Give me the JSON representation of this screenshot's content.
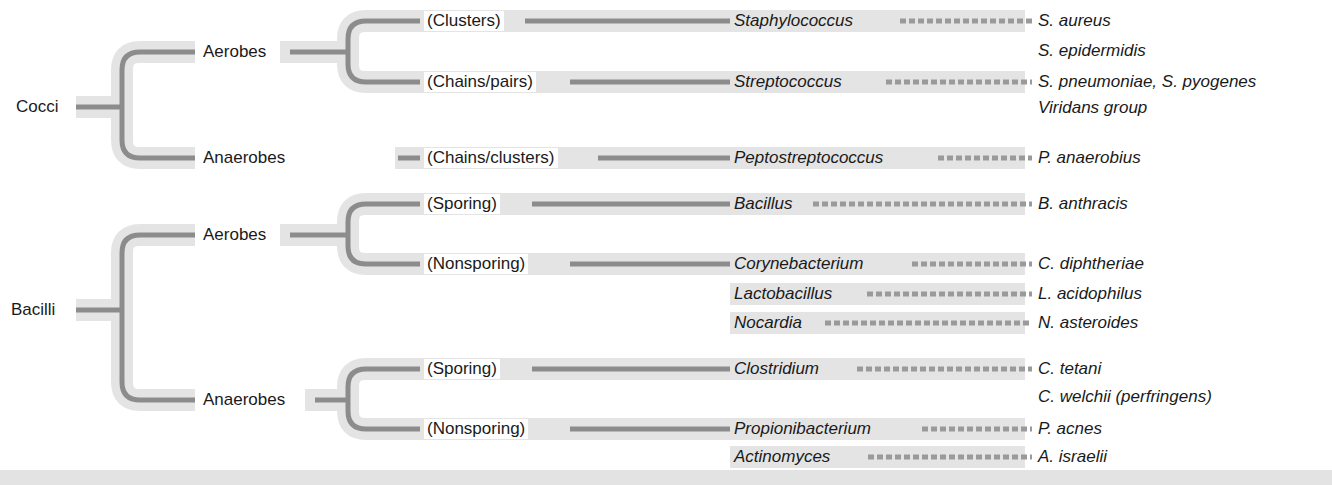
{
  "colors": {
    "line": "#8c8c8c",
    "halo": "#e4e4e4",
    "dash": "#9a9a9a",
    "text": "#1a1a1a"
  },
  "root": {
    "cocci": "Cocci",
    "bacilli": "Bacilli"
  },
  "cocci": {
    "aerobes": "Aerobes",
    "anaerobes": "Anaerobes",
    "groups": [
      {
        "label": "(Clusters)",
        "genus": "Staphylococcus",
        "species": [
          "S. aureus",
          "S. epidermidis"
        ]
      },
      {
        "label": "(Chains/pairs)",
        "genus": "Streptococcus",
        "species": [
          "S. pneumoniae, S. pyogenes",
          "Viridans group"
        ]
      },
      {
        "label": "(Chains/clusters)",
        "genus": "Peptostreptococcus",
        "species": [
          "P. anaerobius"
        ]
      }
    ]
  },
  "bacilli": {
    "aerobes": "Aerobes",
    "anaerobes": "Anaerobes",
    "groups": [
      {
        "label": "(Sporing)",
        "genus": "Bacillus",
        "species": [
          "B. anthracis"
        ]
      },
      {
        "label": "(Nonsporing)",
        "genus": "Corynebacterium",
        "species": [
          "C. diphtheriae"
        ]
      },
      {
        "label": "",
        "genus": "Lactobacillus",
        "species": [
          "L. acidophilus"
        ]
      },
      {
        "label": "",
        "genus": "Nocardia",
        "species": [
          "N. asteroides"
        ]
      },
      {
        "label": "(Sporing)",
        "genus": "Clostridium",
        "species": [
          "C. tetani",
          "C. welchii (perfringens)"
        ]
      },
      {
        "label": "(Nonsporing)",
        "genus": "Propionibacterium",
        "species": [
          "P. acnes"
        ]
      },
      {
        "label": "",
        "genus": "Actinomyces",
        "species": [
          "A. israelii"
        ]
      }
    ]
  }
}
